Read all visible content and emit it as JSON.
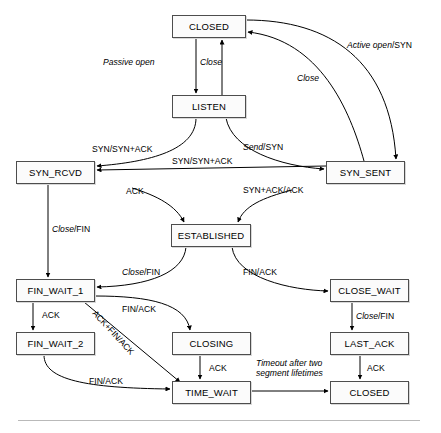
{
  "states": [
    {
      "id": "closed-top",
      "label": "CLOSED",
      "x": 172,
      "y": 15,
      "w": 74,
      "h": 23
    },
    {
      "id": "listen",
      "label": "LISTEN",
      "x": 172,
      "y": 95,
      "w": 74,
      "h": 23
    },
    {
      "id": "syn-rcvd",
      "label": "SYN_RCVD",
      "x": 16,
      "y": 161,
      "w": 79,
      "h": 23
    },
    {
      "id": "syn-sent",
      "label": "SYN_SENT",
      "x": 326,
      "y": 161,
      "w": 79,
      "h": 23
    },
    {
      "id": "established",
      "label": "ESTABLISHED",
      "x": 171,
      "y": 224,
      "w": 80,
      "h": 23
    },
    {
      "id": "fin-wait-1",
      "label": "FIN_WAIT_1",
      "x": 16,
      "y": 279,
      "w": 79,
      "h": 23
    },
    {
      "id": "close-wait",
      "label": "CLOSE_WAIT",
      "x": 330,
      "y": 279,
      "w": 79,
      "h": 23
    },
    {
      "id": "fin-wait-2",
      "label": "FIN_WAIT_2",
      "x": 16,
      "y": 332,
      "w": 79,
      "h": 23
    },
    {
      "id": "closing",
      "label": "CLOSING",
      "x": 172,
      "y": 332,
      "w": 79,
      "h": 23
    },
    {
      "id": "last-ack",
      "label": "LAST_ACK",
      "x": 330,
      "y": 332,
      "w": 79,
      "h": 23
    },
    {
      "id": "time-wait",
      "label": "TIME_WAIT",
      "x": 172,
      "y": 381,
      "w": 79,
      "h": 23
    },
    {
      "id": "closed-bottom",
      "label": "CLOSED",
      "x": 330,
      "y": 381,
      "w": 79,
      "h": 23
    }
  ],
  "edge_labels": [
    {
      "id": "passive-open",
      "italic": "Passive open",
      "roman": "",
      "x": 103,
      "y": 58
    },
    {
      "id": "close-listen",
      "italic": "Close",
      "roman": "",
      "x": 200,
      "y": 58
    },
    {
      "id": "active-open-syn",
      "italic": "Active open",
      "roman": "/SYN",
      "x": 347,
      "y": 41
    },
    {
      "id": "close-synsent",
      "italic": "Close",
      "roman": "",
      "x": 297,
      "y": 74
    },
    {
      "id": "syn-synack-upper",
      "italic": "",
      "roman": "SYN/SYN+ACK",
      "x": 92,
      "y": 145
    },
    {
      "id": "send-syn",
      "italic": "Send",
      "roman": "/SYN",
      "x": 243,
      "y": 143
    },
    {
      "id": "syn-synack-lower",
      "italic": "",
      "roman": "SYN/SYN+ACK",
      "x": 172,
      "y": 157
    },
    {
      "id": "ack-to-estab",
      "italic": "",
      "roman": "ACK",
      "x": 126,
      "y": 187
    },
    {
      "id": "synack-ack",
      "italic": "",
      "roman": "SYN+ACK/ACK",
      "x": 243,
      "y": 186
    },
    {
      "id": "close-fin-left",
      "italic": "Close",
      "roman": "/FIN",
      "x": 52,
      "y": 225
    },
    {
      "id": "close-fin-estab",
      "italic": "Close",
      "roman": "/FIN",
      "x": 122,
      "y": 268
    },
    {
      "id": "fin-ack-estab",
      "italic": "",
      "roman": "FIN/ACK",
      "x": 243,
      "y": 268
    },
    {
      "id": "ack-finwait",
      "italic": "",
      "roman": "ACK",
      "x": 42,
      "y": 311
    },
    {
      "id": "fin-ack-closing",
      "italic": "",
      "roman": "FIN/ACK",
      "x": 122,
      "y": 305
    },
    {
      "id": "ack-fin-ack-diag",
      "italic": "",
      "roman": "ACK+FIN/ACK",
      "x": 97,
      "y": 309
    },
    {
      "id": "close-fin-right",
      "italic": "Close",
      "roman": "/FIN",
      "x": 356,
      "y": 312
    },
    {
      "id": "ack-closing",
      "italic": "",
      "roman": "ACK",
      "x": 209,
      "y": 364
    },
    {
      "id": "ack-lastack",
      "italic": "",
      "roman": "ACK",
      "x": 367,
      "y": 364
    },
    {
      "id": "fin-ack-bottom",
      "italic": "",
      "roman": "FIN/ACK",
      "x": 89,
      "y": 377
    }
  ],
  "timeout_label": {
    "id": "timeout-two-msl",
    "line1": "Timeout after two",
    "line2": "segment lifetimes",
    "x": 256,
    "y": 359
  },
  "colors": {
    "box_border": "#4d4d4d",
    "box_fill": "#fbfbfb",
    "arrow": "#000000",
    "rule": "#b9b9b9"
  }
}
